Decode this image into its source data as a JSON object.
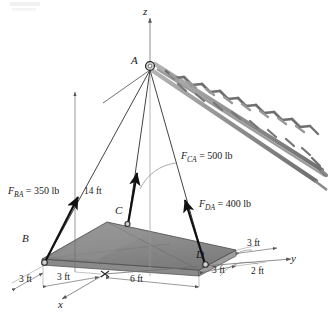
{
  "figure": {
    "type": "statics-free-body-diagram",
    "axes": {
      "x": "x",
      "y": "y",
      "z": "z"
    },
    "points": {
      "a": "A",
      "b": "B",
      "c": "C",
      "d": "D"
    },
    "forces": [
      {
        "id": "FBA",
        "symbol": "F",
        "sub": "BA",
        "eq": "=",
        "value": "350",
        "unit": "lb",
        "text": "F_BA = 350 lb"
      },
      {
        "id": "FCA",
        "symbol": "F",
        "sub": "CA",
        "eq": "=",
        "value": "500",
        "unit": "lb",
        "text": "F_CA = 500 lb"
      },
      {
        "id": "FDA",
        "symbol": "F",
        "sub": "DA",
        "eq": "=",
        "value": "400",
        "unit": "lb",
        "text": "F_DA = 400 lb"
      }
    ],
    "dimensions": [
      {
        "id": "height",
        "text": "14 ft"
      },
      {
        "id": "x-left-outer",
        "text": "3 ft"
      },
      {
        "id": "x-left-inner",
        "text": "3 ft"
      },
      {
        "id": "y-plate-span",
        "text": "6 ft"
      },
      {
        "id": "y-right-upper",
        "text": "3 ft"
      },
      {
        "id": "y-right-lower",
        "text": "3 ft"
      },
      {
        "id": "y-right-outer",
        "text": "2 ft"
      }
    ],
    "colors": {
      "plate_top": "#8f8f8f",
      "plate_shade": "#7a7a7a",
      "plate_edge": "#5a5a5a",
      "truss": "#8c8c8c",
      "line": "#1a1a1a",
      "thin_line": "#6e6e6e"
    }
  }
}
